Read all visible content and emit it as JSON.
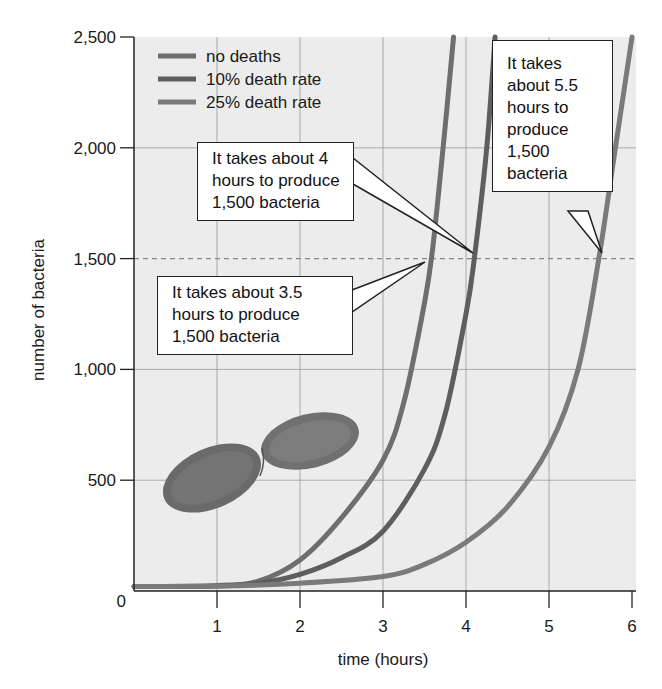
{
  "chart_data": {
    "type": "line",
    "title": "",
    "xlabel": "time (hours)",
    "ylabel": "number of bacteria",
    "xlim": [
      0,
      6
    ],
    "ylim": [
      0,
      2500
    ],
    "xticks": [
      "1",
      "2",
      "3",
      "4",
      "5",
      "6"
    ],
    "yticks": [
      "0",
      "500",
      "1,000",
      "1,500",
      "2,000",
      "2,500"
    ],
    "grid": true,
    "reference_line": {
      "y": 1500,
      "style": "dashed"
    },
    "legend_position": "upper left",
    "series": [
      {
        "name": "no deaths",
        "color": "#6e6e6e",
        "x": [
          0,
          1,
          1.5,
          2,
          2.5,
          3,
          3.25,
          3.5,
          3.6,
          3.75,
          3.85
        ],
        "y": [
          20,
          25,
          45,
          140,
          330,
          590,
          850,
          1300,
          1550,
          2100,
          2500
        ]
      },
      {
        "name": "10% death rate",
        "color": "#5e5e5e",
        "x": [
          0,
          1,
          1.5,
          2,
          2.5,
          3,
          3.5,
          3.75,
          4,
          4.1,
          4.25,
          4.35
        ],
        "y": [
          20,
          22,
          35,
          75,
          150,
          270,
          550,
          800,
          1250,
          1500,
          2000,
          2500
        ]
      },
      {
        "name": "25% death rate",
        "color": "#7a7a7a",
        "x": [
          0,
          1,
          2,
          3,
          3.5,
          4,
          4.5,
          5,
          5.35,
          5.6,
          5.8,
          6
        ],
        "y": [
          20,
          22,
          35,
          65,
          120,
          220,
          380,
          650,
          1000,
          1500,
          2000,
          2500
        ]
      }
    ],
    "annotations": [
      {
        "text": "It takes about 3.5 hours to produce 1,500 bacteria",
        "points_to": {
          "x": 3.5,
          "y": 1500
        }
      },
      {
        "text": "It takes about 4 hours to produce 1,500 bacteria",
        "points_to": {
          "x": 4.1,
          "y": 1500
        }
      },
      {
        "text": "It takes about 5.5 hours to produce 1,500 bacteria",
        "points_to": {
          "x": 5.6,
          "y": 1500
        }
      }
    ],
    "decoration": "bacterium illustration (rod-shaped, dividing) in lower-left of plot"
  },
  "legend": {
    "items": [
      {
        "label": "no deaths",
        "color": "#6e6e6e"
      },
      {
        "label": "10% death rate",
        "color": "#5e5e5e"
      },
      {
        "label": "25% death rate",
        "color": "#7a7a7a"
      }
    ]
  },
  "callouts": {
    "c35": {
      "lines": [
        "It takes about 3.5",
        "hours to produce",
        "1,500 bacteria"
      ]
    },
    "c4": {
      "lines": [
        "It takes about 4",
        "hours to produce",
        "1,500 bacteria"
      ]
    },
    "c55": {
      "lines": [
        "It takes",
        "about 5.5",
        "hours to",
        "produce",
        "1,500",
        "bacteria"
      ]
    }
  },
  "colors": {
    "plot_bg": "#ececec",
    "grid": "#9a9a9a",
    "axis": "#222222"
  }
}
